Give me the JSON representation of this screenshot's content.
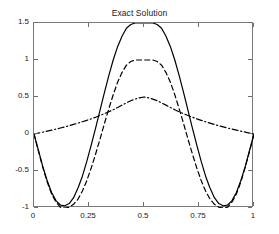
{
  "chart_data": {
    "type": "line",
    "title": "Exact Solution",
    "xlabel": "",
    "ylabel": "",
    "xlim": [
      0,
      1
    ],
    "ylim": [
      -1,
      1.5
    ],
    "xticks": [
      0,
      0.25,
      0.5,
      0.75,
      1
    ],
    "xtick_labels": [
      "0",
      "0.25",
      "0.5",
      "0.75",
      "1"
    ],
    "yticks": [
      -1,
      -0.5,
      0,
      0.5,
      1,
      1.5
    ],
    "ytick_labels": [
      "-1",
      "-0.5",
      "0",
      "0.5",
      "1",
      "1.5"
    ],
    "grid": false,
    "legend": null,
    "line_color": "#000000",
    "background": "#ffffff",
    "axis_color": "#7a7a7a",
    "series": [
      {
        "name": "solid",
        "style": "solid",
        "color": "#000000",
        "peak": 1.5,
        "peak_x": 0.5,
        "min": -0.97,
        "min_x": [
          0.165,
          0.835
        ],
        "x": [
          0.0,
          0.02,
          0.04,
          0.06,
          0.08,
          0.1,
          0.12,
          0.14,
          0.16,
          0.18,
          0.2,
          0.22,
          0.24,
          0.26,
          0.28,
          0.3,
          0.32,
          0.34,
          0.36,
          0.38,
          0.4,
          0.42,
          0.44,
          0.46,
          0.48,
          0.5,
          0.52,
          0.54,
          0.56,
          0.58,
          0.6,
          0.62,
          0.64,
          0.66,
          0.68,
          0.7,
          0.72,
          0.74,
          0.76,
          0.78,
          0.8,
          0.82,
          0.84,
          0.86,
          0.88,
          0.9,
          0.92,
          0.94,
          0.96,
          0.98,
          1.0
        ],
        "y": [
          0.0,
          -0.22,
          -0.44,
          -0.63,
          -0.79,
          -0.9,
          -0.96,
          -0.97,
          -0.94,
          -0.86,
          -0.73,
          -0.57,
          -0.37,
          -0.15,
          0.08,
          0.32,
          0.56,
          0.79,
          1.0,
          1.18,
          1.32,
          1.43,
          1.48,
          1.5,
          1.5,
          1.5,
          1.5,
          1.5,
          1.48,
          1.43,
          1.32,
          1.18,
          1.0,
          0.79,
          0.56,
          0.32,
          0.08,
          -0.15,
          -0.37,
          -0.57,
          -0.73,
          -0.86,
          -0.94,
          -0.97,
          -0.96,
          -0.9,
          -0.79,
          -0.63,
          -0.44,
          -0.22,
          0.0
        ]
      },
      {
        "name": "dashed",
        "style": "dashed",
        "color": "#000000",
        "peak": 1.0,
        "peak_x": 0.5,
        "min": -1.0,
        "min_x": [
          0.17,
          0.83
        ],
        "x": [
          0.0,
          0.02,
          0.04,
          0.06,
          0.08,
          0.1,
          0.12,
          0.14,
          0.16,
          0.18,
          0.2,
          0.22,
          0.24,
          0.26,
          0.28,
          0.3,
          0.32,
          0.34,
          0.36,
          0.38,
          0.4,
          0.42,
          0.44,
          0.46,
          0.48,
          0.5,
          0.52,
          0.54,
          0.56,
          0.58,
          0.6,
          0.62,
          0.64,
          0.66,
          0.68,
          0.7,
          0.72,
          0.74,
          0.76,
          0.78,
          0.8,
          0.82,
          0.84,
          0.86,
          0.88,
          0.9,
          0.92,
          0.94,
          0.96,
          0.98,
          1.0
        ],
        "y": [
          0.0,
          -0.23,
          -0.45,
          -0.65,
          -0.81,
          -0.92,
          -0.99,
          -1.0,
          -0.99,
          -0.95,
          -0.88,
          -0.77,
          -0.63,
          -0.46,
          -0.27,
          -0.07,
          0.14,
          0.34,
          0.53,
          0.7,
          0.83,
          0.93,
          0.98,
          1.0,
          1.0,
          1.0,
          1.0,
          1.0,
          0.98,
          0.93,
          0.83,
          0.7,
          0.53,
          0.34,
          0.14,
          -0.07,
          -0.27,
          -0.46,
          -0.63,
          -0.77,
          -0.88,
          -0.95,
          -0.99,
          -1.0,
          -0.99,
          -0.92,
          -0.81,
          -0.65,
          -0.45,
          -0.23,
          0.0
        ]
      },
      {
        "name": "dash-dot",
        "style": "dashdot",
        "color": "#000000",
        "peak": 0.5,
        "peak_x": 0.5,
        "min": 0.0,
        "min_x": [
          0.0,
          1.0
        ],
        "x": [
          0.0,
          0.02,
          0.04,
          0.06,
          0.08,
          0.1,
          0.12,
          0.14,
          0.16,
          0.18,
          0.2,
          0.22,
          0.24,
          0.26,
          0.28,
          0.3,
          0.32,
          0.34,
          0.36,
          0.38,
          0.4,
          0.42,
          0.44,
          0.46,
          0.48,
          0.5,
          0.52,
          0.54,
          0.56,
          0.58,
          0.6,
          0.62,
          0.64,
          0.66,
          0.68,
          0.7,
          0.72,
          0.74,
          0.76,
          0.78,
          0.8,
          0.82,
          0.84,
          0.86,
          0.88,
          0.9,
          0.92,
          0.94,
          0.96,
          0.98,
          1.0
        ],
        "y": [
          0.0,
          0.012,
          0.025,
          0.038,
          0.052,
          0.066,
          0.081,
          0.096,
          0.112,
          0.129,
          0.147,
          0.165,
          0.185,
          0.205,
          0.227,
          0.25,
          0.274,
          0.3,
          0.328,
          0.358,
          0.39,
          0.42,
          0.45,
          0.472,
          0.489,
          0.5,
          0.489,
          0.472,
          0.45,
          0.42,
          0.39,
          0.358,
          0.328,
          0.3,
          0.274,
          0.25,
          0.227,
          0.205,
          0.185,
          0.165,
          0.147,
          0.129,
          0.112,
          0.096,
          0.081,
          0.066,
          0.052,
          0.038,
          0.025,
          0.012,
          0.0
        ]
      }
    ]
  }
}
